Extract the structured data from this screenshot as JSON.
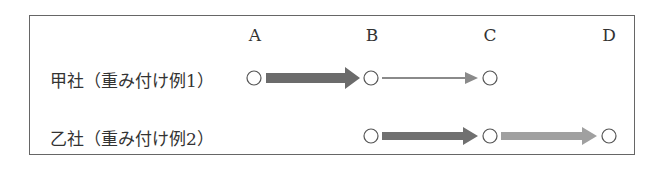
{
  "columns": [
    {
      "label": "A",
      "x": 255
    },
    {
      "label": "B",
      "x": 372
    },
    {
      "label": "C",
      "x": 490
    },
    {
      "label": "D",
      "x": 609
    }
  ],
  "rows": [
    {
      "label": "甲社（重み付け例1）",
      "y": 78,
      "nodes": [
        "A",
        "B",
        "C"
      ],
      "arrows": [
        {
          "from": "A",
          "to": "B",
          "weight": "thick",
          "color": "#6b6b6b"
        },
        {
          "from": "B",
          "to": "C",
          "weight": "thin",
          "color": "#8a8a8a"
        }
      ]
    },
    {
      "label": "乙社（重み付け例2）",
      "y": 136,
      "nodes": [
        "B",
        "C",
        "D"
      ],
      "arrows": [
        {
          "from": "B",
          "to": "C",
          "weight": "medium",
          "color": "#707070"
        },
        {
          "from": "C",
          "to": "D",
          "weight": "medium",
          "color": "#a0a0a0"
        }
      ]
    }
  ]
}
